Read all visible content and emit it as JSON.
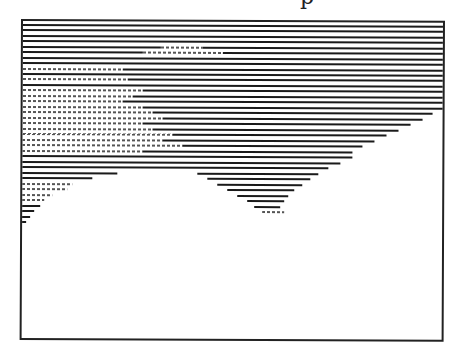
{
  "figure": {
    "title_fragment": "p",
    "frame": {
      "x": 21,
      "y": 19,
      "width": 420,
      "height": 317,
      "stroke": "#222222"
    },
    "line_color": "#1a1a1a",
    "line_pitch": 5.4,
    "rows": [
      {
        "y": 3,
        "segments": [
          [
            0,
            420
          ]
        ]
      },
      {
        "y": 8,
        "segments": [
          [
            0,
            420
          ]
        ]
      },
      {
        "y": 14,
        "segments": [
          [
            0,
            420
          ]
        ]
      },
      {
        "y": 19,
        "segments": [
          [
            0,
            420
          ]
        ]
      },
      {
        "y": 25,
        "segments": [
          [
            0,
            138,
            "d"
          ],
          [
            138,
            180,
            "l"
          ],
          [
            180,
            420,
            "d"
          ]
        ]
      },
      {
        "y": 30,
        "segments": [
          [
            0,
            120,
            "d"
          ],
          [
            120,
            200,
            "l"
          ],
          [
            200,
            420,
            "d"
          ]
        ]
      },
      {
        "y": 36,
        "segments": [
          [
            0,
            420
          ]
        ]
      },
      {
        "y": 41,
        "segments": [
          [
            0,
            420
          ]
        ]
      },
      {
        "y": 47,
        "segments": [
          [
            0,
            100,
            "l"
          ],
          [
            100,
            420,
            "d"
          ]
        ]
      },
      {
        "y": 52,
        "segments": [
          [
            0,
            420
          ]
        ]
      },
      {
        "y": 57,
        "segments": [
          [
            0,
            105,
            "l"
          ],
          [
            105,
            420,
            "d"
          ]
        ]
      },
      {
        "y": 63,
        "segments": [
          [
            0,
            420
          ]
        ]
      },
      {
        "y": 68,
        "segments": [
          [
            0,
            120,
            "l"
          ],
          [
            120,
            420,
            "d"
          ]
        ]
      },
      {
        "y": 74,
        "segments": [
          [
            0,
            110,
            "l"
          ],
          [
            110,
            420,
            "d"
          ]
        ]
      },
      {
        "y": 79,
        "segments": [
          [
            0,
            100,
            "l"
          ],
          [
            100,
            420,
            "d"
          ]
        ]
      },
      {
        "y": 85,
        "segments": [
          [
            0,
            120,
            "l"
          ],
          [
            120,
            420,
            "d"
          ]
        ]
      },
      {
        "y": 90,
        "segments": [
          [
            0,
            130,
            "l"
          ],
          [
            130,
            410,
            "d"
          ]
        ]
      },
      {
        "y": 96,
        "segments": [
          [
            0,
            140,
            "l"
          ],
          [
            140,
            400,
            "d"
          ]
        ]
      },
      {
        "y": 101,
        "segments": [
          [
            0,
            120,
            "l"
          ],
          [
            120,
            388,
            "d"
          ]
        ]
      },
      {
        "y": 107,
        "segments": [
          [
            0,
            130,
            "l"
          ],
          [
            130,
            376,
            "d"
          ]
        ]
      },
      {
        "y": 112,
        "segments": [
          [
            0,
            150,
            "l"
          ],
          [
            150,
            364,
            "d"
          ]
        ]
      },
      {
        "y": 118,
        "segments": [
          [
            0,
            140,
            "l"
          ],
          [
            140,
            352,
            "d"
          ]
        ]
      },
      {
        "y": 123,
        "segments": [
          [
            0,
            160,
            "l"
          ],
          [
            160,
            340,
            "d"
          ]
        ]
      },
      {
        "y": 129,
        "segments": [
          [
            0,
            120,
            "l"
          ],
          [
            120,
            330,
            "d"
          ]
        ]
      },
      {
        "y": 134,
        "segments": [
          [
            0,
            330,
            "d"
          ]
        ]
      },
      {
        "y": 140,
        "segments": [
          [
            0,
            318,
            "d"
          ]
        ]
      },
      {
        "y": 145,
        "segments": [
          [
            0,
            306,
            "d"
          ]
        ]
      },
      {
        "y": 151,
        "segments": [
          [
            0,
            95,
            "d"
          ],
          [
            175,
            296,
            "d"
          ]
        ]
      },
      {
        "y": 156,
        "segments": [
          [
            0,
            70,
            "d"
          ],
          [
            185,
            288,
            "d"
          ]
        ]
      },
      {
        "y": 162,
        "segments": [
          [
            0,
            50,
            "l"
          ],
          [
            195,
            280,
            "d"
          ]
        ]
      },
      {
        "y": 167,
        "segments": [
          [
            0,
            45,
            "l"
          ],
          [
            205,
            272,
            "d"
          ]
        ]
      },
      {
        "y": 173,
        "segments": [
          [
            0,
            30,
            "l"
          ],
          [
            215,
            266,
            "d"
          ]
        ]
      },
      {
        "y": 178,
        "segments": [
          [
            0,
            22,
            "l"
          ],
          [
            225,
            262,
            "d"
          ]
        ]
      },
      {
        "y": 184,
        "segments": [
          [
            0,
            18,
            "d"
          ],
          [
            232,
            258,
            "d"
          ]
        ]
      },
      {
        "y": 189,
        "segments": [
          [
            0,
            12,
            "d"
          ],
          [
            240,
            262,
            "l"
          ]
        ]
      },
      {
        "y": 195,
        "segments": [
          [
            0,
            8,
            "d"
          ]
        ]
      },
      {
        "y": 200,
        "segments": [
          [
            0,
            4,
            "d"
          ]
        ]
      }
    ]
  }
}
